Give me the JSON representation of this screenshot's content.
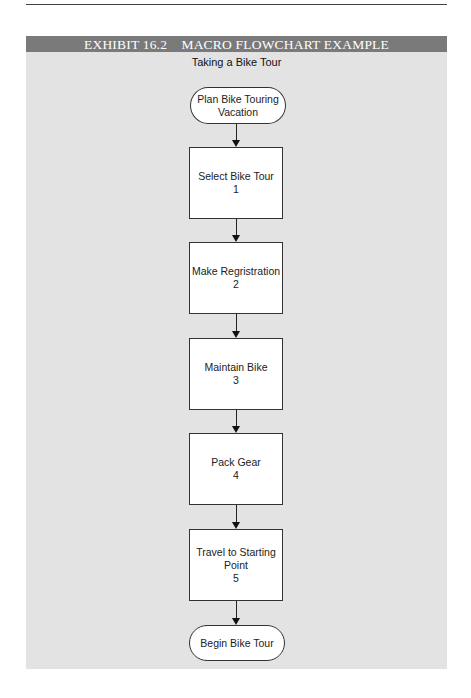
{
  "exhibit": {
    "header": "EXHIBIT 16.2    MACRO FLOWCHART EXAMPLE",
    "title": "Taking a Bike Tour"
  },
  "flowchart": {
    "start": {
      "type": "terminator",
      "lines": [
        "Plan Bike Touring",
        "Vacation"
      ]
    },
    "steps": [
      {
        "type": "process",
        "label": "Select Bike Tour",
        "number": "1"
      },
      {
        "type": "process",
        "label": "Make Regristration",
        "number": "2"
      },
      {
        "type": "process",
        "label": "Maintain Bike",
        "number": "3"
      },
      {
        "type": "process",
        "label": "Pack Gear",
        "number": "4"
      },
      {
        "type": "process",
        "label_line1": "Travel to Starting",
        "label_line2": "Point",
        "number": "5"
      }
    ],
    "end": {
      "type": "terminator",
      "lines": [
        "Begin Bike Tour"
      ]
    }
  },
  "colors": {
    "header_bg": "#7a7a7a",
    "panel_bg": "#e3e3e3",
    "node_bg": "#ffffff",
    "stroke": "#333333"
  }
}
